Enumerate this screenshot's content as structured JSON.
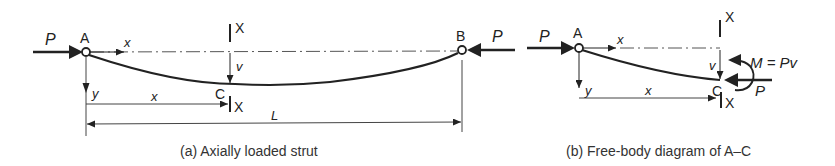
{
  "diagram_a": {
    "caption": "(a) Axially loaded strut",
    "labels": {
      "load_left": "P",
      "load_right": "P",
      "node_a": "A",
      "node_b": "B",
      "node_c": "C",
      "axis_x": "x",
      "axis_y": "y",
      "deflection": "v",
      "dimension_x": "x",
      "dimension_length": "L",
      "section_top": "X",
      "section_bottom": "X"
    }
  },
  "diagram_b": {
    "caption": "(b) Free-body diagram of A–C",
    "labels": {
      "load_left": "P",
      "load_right": "P",
      "node_a": "A",
      "node_c": "C",
      "axis_x": "x",
      "axis_y": "y",
      "deflection": "v",
      "dimension_x": "x",
      "moment": "M = Pv",
      "section_top": "X",
      "section_bottom": "X"
    }
  },
  "colors": {
    "line": "#222222",
    "thin_line": "#444444",
    "background": "#ffffff"
  }
}
